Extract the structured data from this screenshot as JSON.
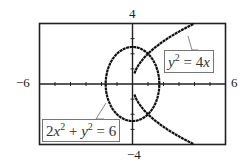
{
  "chart_data": {
    "type": "line",
    "title": "",
    "xlabel": "",
    "ylabel": "",
    "xlim": [
      -6,
      6
    ],
    "ylim": [
      -4,
      4
    ],
    "tick_labels": {
      "xmin": "−6",
      "xmax": "6",
      "ymax": "4",
      "ymin": "−4"
    },
    "grid": false,
    "series": [
      {
        "name": "2x^2 + y^2 = 6",
        "kind": "ellipse",
        "equation": "2x² + y² = 6"
      },
      {
        "name": "y^2 = 4x",
        "kind": "parabola",
        "equation": "y² = 4x"
      }
    ],
    "annotations": [
      {
        "text": "y² = 4x",
        "target": "parabola upper branch"
      },
      {
        "text": "2x² + y² = 6",
        "target": "ellipse left side"
      }
    ]
  },
  "labels": {
    "xmin": "−6",
    "xmax": "6",
    "ymax": "4",
    "ymin": "−4"
  }
}
